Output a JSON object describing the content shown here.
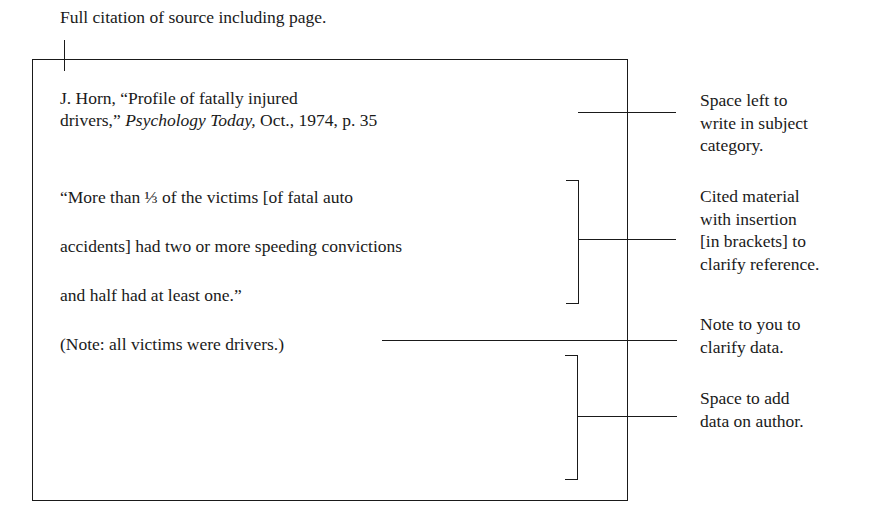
{
  "top_caption": "Full citation of source including page.",
  "card": {
    "citation": {
      "line1": "J. Horn, “Profile of fatally injured",
      "line2_pre": "drivers,” ",
      "line2_journal": "Psychology Today,",
      "line2_post": " Oct., 1974, p. 35"
    },
    "quote_lines": [
      "“More than ⅓ of the victims [of fatal auto",
      "accidents] had two or more speeding convictions",
      "and half had at least one.”"
    ],
    "note": "(Note: all victims were drivers.)"
  },
  "annotations": [
    {
      "id": "subject-category",
      "lines": [
        "Space left to",
        "write in subject",
        "category."
      ]
    },
    {
      "id": "cited-material",
      "lines": [
        "Cited material",
        "with insertion",
        "[in brackets] to",
        "clarify reference."
      ]
    },
    {
      "id": "note-to-you",
      "lines": [
        "Note to you to",
        "clarify data."
      ]
    },
    {
      "id": "author-data",
      "lines": [
        "Space to add",
        "data on author."
      ]
    }
  ]
}
